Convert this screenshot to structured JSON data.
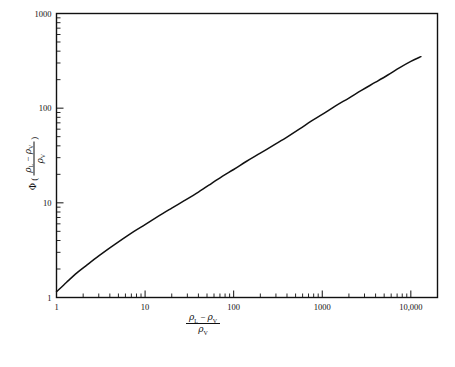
{
  "figure": {
    "background_color": "#ffffff",
    "line_color": "#111111",
    "axis_color": "#111111"
  },
  "xlabel": {
    "numerator_rho_l": "ρ",
    "numerator_rho_l_sub": "L",
    "minus": "−",
    "numerator_rho_v": "ρ",
    "numerator_rho_v_sub": "V",
    "denominator_rho_v": "ρ",
    "denominator_rho_v_sub": "V"
  },
  "ylabel": {
    "phi": "Φ",
    "open_paren": "(",
    "close_paren": ")",
    "numerator_rho_l": "ρ",
    "numerator_rho_l_sub": "L",
    "minus": "−",
    "numerator_rho_v": "ρ",
    "numerator_rho_v_sub": "V",
    "denominator_rho_v": "ρ",
    "denominator_rho_v_sub": "V"
  },
  "chart_data": {
    "type": "line",
    "title": "",
    "subtitle": "",
    "xlabel": "(ρL − ρV) / ρV",
    "ylabel": "Φ ( (ρL − ρV) / ρV )",
    "xscale": "log",
    "yscale": "log",
    "xlim": [
      1,
      20000
    ],
    "ylim": [
      1,
      1000
    ],
    "grid": false,
    "legend": null,
    "annotations": [],
    "x_major_ticks": [
      1,
      10,
      100,
      1000,
      10000
    ],
    "x_major_tick_labels": [
      "1",
      "10",
      "100",
      "1000",
      "10,000"
    ],
    "y_major_ticks": [
      1,
      10,
      100,
      1000
    ],
    "y_major_tick_labels": [
      "1",
      "10",
      "100",
      "1000"
    ],
    "x_minor_ticks_per_decade": [
      2,
      3,
      4,
      5,
      6,
      7,
      8,
      9
    ],
    "y_minor_ticks_per_decade": [
      2,
      3,
      4,
      5,
      6,
      7,
      8,
      9
    ],
    "tick_direction": "in",
    "series": [
      {
        "name": "phi-curve",
        "x": [
          1,
          1.3,
          1.7,
          2.2,
          3,
          4,
          5.5,
          7.5,
          10,
          14,
          20,
          28,
          40,
          55,
          75,
          100,
          140,
          200,
          280,
          400,
          550,
          750,
          1000,
          1400,
          2000,
          2800,
          4000,
          5500,
          7500,
          10000,
          13000
        ],
        "y": [
          1.15,
          1.45,
          1.82,
          2.2,
          2.75,
          3.35,
          4.1,
          5.0,
          5.9,
          7.2,
          8.8,
          10.6,
          13.0,
          15.8,
          19.2,
          22.5,
          27.5,
          33.5,
          40.5,
          49.5,
          60.0,
          73.0,
          86.0,
          105.0,
          128.0,
          155.0,
          188.0,
          224.0,
          268.0,
          312.0,
          350.0
        ]
      }
    ]
  }
}
